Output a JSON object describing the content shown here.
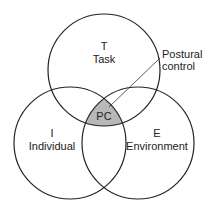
{
  "diagram": {
    "type": "venn",
    "circles": [
      {
        "id": "task",
        "letter": "T",
        "label": "Task"
      },
      {
        "id": "individual",
        "letter": "I",
        "label": "Individual"
      },
      {
        "id": "environment",
        "letter": "E",
        "label": "Environment"
      }
    ],
    "intersection": {
      "label": "PC",
      "fill": "#b8b8b8"
    },
    "callout": {
      "line1": "Postural",
      "line2": "control"
    },
    "stroke_color": "#222222"
  }
}
